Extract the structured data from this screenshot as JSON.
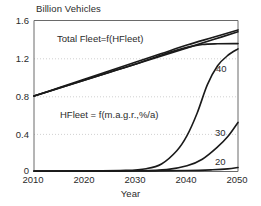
{
  "chart_data": {
    "type": "line",
    "title": "",
    "ylabel": "Billion Vehicles",
    "xlabel": "Year",
    "xlim": [
      2010,
      2050
    ],
    "ylim": [
      0,
      1.6
    ],
    "xticks": [
      "2010",
      "2020",
      "2030",
      "2040",
      "2050"
    ],
    "yticks": [
      "1.6",
      "1.2",
      "0.8",
      "0.4",
      "0"
    ],
    "grid": "horizontal dotted at 0.4, 0.8, 1.2",
    "legend": "inline curve labels at right edge",
    "annotations": [
      {
        "text": "Total Fleet=f(HFleet)",
        "x": 2021,
        "y": 1.33
      },
      {
        "text": "HFleet = f(m.a.g.r.,%/a)",
        "x": 2022,
        "y": 0.63
      }
    ],
    "series": [
      {
        "name": "Total Fleet (upper)",
        "label": "",
        "x": [
          2010,
          2015,
          2020,
          2025,
          2030,
          2035,
          2040,
          2045,
          2050
        ],
        "values": [
          0.8,
          0.89,
          0.98,
          1.07,
          1.16,
          1.25,
          1.34,
          1.42,
          1.5
        ]
      },
      {
        "name": "Total Fleet (lower)",
        "label": "",
        "x": [
          2010,
          2015,
          2020,
          2025,
          2030,
          2035,
          2040,
          2045,
          2050
        ],
        "values": [
          0.8,
          0.885,
          0.97,
          1.055,
          1.14,
          1.225,
          1.31,
          1.395,
          1.48
        ]
      },
      {
        "name": "Total Fleet (saturating)",
        "label": "",
        "x": [
          2010,
          2015,
          2020,
          2025,
          2030,
          2035,
          2040,
          2043,
          2046,
          2050
        ],
        "values": [
          0.8,
          0.885,
          0.97,
          1.055,
          1.14,
          1.235,
          1.315,
          1.345,
          1.353,
          1.355
        ]
      },
      {
        "name": "HFleet 40 %/a",
        "label": "40",
        "x": [
          2010,
          2020,
          2028,
          2032,
          2035,
          2038,
          2040,
          2042,
          2044,
          2046,
          2048,
          2050
        ],
        "values": [
          0.005,
          0.006,
          0.012,
          0.03,
          0.08,
          0.22,
          0.38,
          0.62,
          0.92,
          1.12,
          1.23,
          1.3
        ]
      },
      {
        "name": "HFleet 30 %/a",
        "label": "30",
        "x": [
          2010,
          2020,
          2030,
          2036,
          2040,
          2043,
          2046,
          2048,
          2050
        ],
        "values": [
          0.004,
          0.005,
          0.008,
          0.02,
          0.06,
          0.13,
          0.26,
          0.37,
          0.52
        ]
      },
      {
        "name": "HFleet 20 %/a",
        "label": "20",
        "x": [
          2010,
          2020,
          2030,
          2040,
          2045,
          2048,
          2050
        ],
        "values": [
          0.003,
          0.004,
          0.005,
          0.01,
          0.018,
          0.028,
          0.042
        ]
      }
    ]
  },
  "labels": {
    "y_axis_title": "Billion Vehicles",
    "x_axis_title": "Year",
    "ytick_0": "1.6",
    "ytick_1": "1.2",
    "ytick_2": "0.8",
    "ytick_3": "0.4",
    "ytick_4": "0",
    "xtick_0": "2010",
    "xtick_1": "2020",
    "xtick_2": "2030",
    "xtick_3": "2040",
    "xtick_4": "2050",
    "annotation_total_fleet": "Total Fleet=f(HFleet)",
    "annotation_hfleet": "HFleet = f(m.a.g.r.,%/a)",
    "series_label_40": "40",
    "series_label_30": "30",
    "series_label_20": "20"
  },
  "colors": {
    "line": "#1a1a1a",
    "axis": "#555555",
    "grid": "#bdbdbd",
    "text": "#2b2b2b",
    "background": "#ffffff"
  }
}
